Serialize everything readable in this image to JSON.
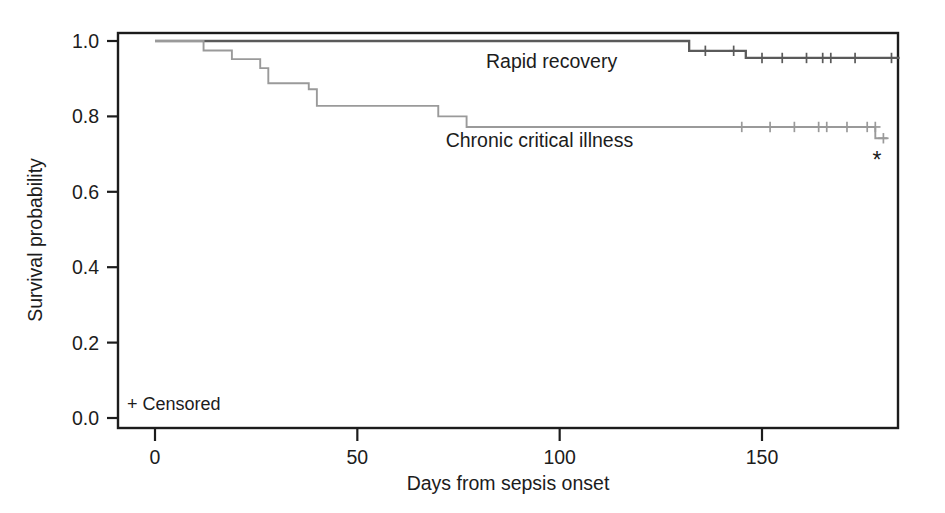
{
  "chart_data": {
    "type": "line",
    "subtype": "kaplan-meier-step",
    "title": "",
    "xlabel": "Days from sepsis onset",
    "ylabel": "Survival probability",
    "xlim": [
      -6,
      184
    ],
    "ylim": [
      0.0,
      1.0
    ],
    "xticks": [
      0,
      50,
      100,
      150
    ],
    "xtick_labels": [
      "0",
      "50",
      "100",
      "150"
    ],
    "yticks": [
      0.0,
      0.2,
      0.4,
      0.6,
      0.8,
      1.0
    ],
    "ytick_labels": [
      "0.0",
      "0.2",
      "0.4",
      "0.6",
      "0.8",
      "1.0"
    ],
    "grid": false,
    "legend_position": "inline-annotations",
    "frame": "full-box",
    "legend": {
      "censored_symbol": "+",
      "censored_label": "Censored",
      "censored_text": "+ Censored"
    },
    "annotations": [
      {
        "name": "asterisk-footnote",
        "text": "*",
        "x_day": 180,
        "y_value": 0.682
      }
    ],
    "series": [
      {
        "name": "Rapid recovery",
        "color": "#5a5a5a",
        "label_x_day": 98,
        "label_y_value": 0.945,
        "final_survival": 0.955,
        "steps": [
          {
            "x": 0,
            "y": 1.0
          },
          {
            "x": 132,
            "y": 1.0
          },
          {
            "x": 132,
            "y": 0.974
          },
          {
            "x": 146,
            "y": 0.974
          },
          {
            "x": 146,
            "y": 0.955
          },
          {
            "x": 184,
            "y": 0.955
          }
        ],
        "censored": [
          {
            "x": 136,
            "y": 0.974
          },
          {
            "x": 143,
            "y": 0.974
          },
          {
            "x": 150,
            "y": 0.955
          },
          {
            "x": 155,
            "y": 0.955
          },
          {
            "x": 161,
            "y": 0.955
          },
          {
            "x": 165,
            "y": 0.955
          },
          {
            "x": 167,
            "y": 0.955
          },
          {
            "x": 173,
            "y": 0.955
          },
          {
            "x": 182,
            "y": 0.955
          }
        ]
      },
      {
        "name": "Chronic critical illness",
        "color": "#9a9a9a",
        "label_x_day": 95,
        "label_y_value": 0.735,
        "final_survival": 0.742,
        "steps": [
          {
            "x": 0,
            "y": 1.0
          },
          {
            "x": 12,
            "y": 1.0
          },
          {
            "x": 12,
            "y": 0.975
          },
          {
            "x": 19,
            "y": 0.975
          },
          {
            "x": 19,
            "y": 0.952
          },
          {
            "x": 26,
            "y": 0.952
          },
          {
            "x": 26,
            "y": 0.928
          },
          {
            "x": 28,
            "y": 0.928
          },
          {
            "x": 28,
            "y": 0.888
          },
          {
            "x": 38,
            "y": 0.888
          },
          {
            "x": 38,
            "y": 0.872
          },
          {
            "x": 40,
            "y": 0.872
          },
          {
            "x": 40,
            "y": 0.828
          },
          {
            "x": 70,
            "y": 0.828
          },
          {
            "x": 70,
            "y": 0.8
          },
          {
            "x": 77,
            "y": 0.8
          },
          {
            "x": 77,
            "y": 0.772
          },
          {
            "x": 178,
            "y": 0.772
          },
          {
            "x": 178,
            "y": 0.742
          },
          {
            "x": 181,
            "y": 0.742
          }
        ],
        "censored": [
          {
            "x": 145,
            "y": 0.772
          },
          {
            "x": 152,
            "y": 0.772
          },
          {
            "x": 158,
            "y": 0.772
          },
          {
            "x": 164,
            "y": 0.772
          },
          {
            "x": 166,
            "y": 0.772
          },
          {
            "x": 171,
            "y": 0.772
          },
          {
            "x": 176,
            "y": 0.772
          },
          {
            "x": 178,
            "y": 0.772
          },
          {
            "x": 180,
            "y": 0.742
          }
        ]
      }
    ]
  }
}
